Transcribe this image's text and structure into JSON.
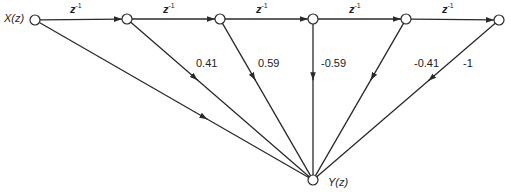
{
  "diagram": {
    "type": "signal-flow-graph",
    "input_label": "X(z)",
    "output_label": "Y(z)",
    "delay_label": "z",
    "delay_exponent": "-1",
    "nodes": [
      {
        "id": "x",
        "x": 35,
        "y": 20
      },
      {
        "id": "n1",
        "x": 127,
        "y": 19
      },
      {
        "id": "n2",
        "x": 220,
        "y": 19
      },
      {
        "id": "n3",
        "x": 313,
        "y": 19
      },
      {
        "id": "n4",
        "x": 406,
        "y": 19
      },
      {
        "id": "n5",
        "x": 499,
        "y": 20
      },
      {
        "id": "y",
        "x": 313,
        "y": 180
      }
    ],
    "coefficients": [
      "1",
      "0.41",
      "0.59",
      "-0.59",
      "-0.41",
      "-1"
    ],
    "coefficient_labels": [
      {
        "text": "0.41",
        "x": 196,
        "y": 62
      },
      {
        "text": "0.59",
        "x": 258,
        "y": 62
      },
      {
        "text": "-0.59",
        "x": 321,
        "y": 62
      },
      {
        "text": "-0.41",
        "x": 414,
        "y": 62
      },
      {
        "text": "-1",
        "x": 463,
        "y": 62
      }
    ],
    "colors": {
      "line": "#2a2a2a",
      "node_fill": "#ffffff",
      "text": "#222222"
    }
  }
}
